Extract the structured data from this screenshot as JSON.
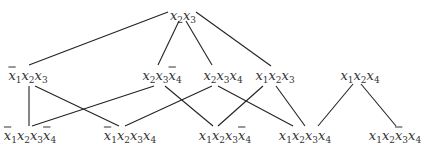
{
  "diagram": {
    "type": "lattice",
    "nodes": [
      {
        "id": "n_top",
        "label": "x2x3",
        "terms": [
          {
            "v": "x",
            "s": "2",
            "neg": false
          },
          {
            "v": "x",
            "s": "3",
            "neg": false
          }
        ],
        "x": 183,
        "y": 15
      },
      {
        "id": "n_m1",
        "label": "¬x1x2x3",
        "terms": [
          {
            "v": "x",
            "s": "1",
            "neg": true
          },
          {
            "v": "x",
            "s": "2",
            "neg": false
          },
          {
            "v": "x",
            "s": "3",
            "neg": false
          }
        ],
        "x": 28,
        "y": 75
      },
      {
        "id": "n_m2",
        "label": "x2x3¬x4",
        "terms": [
          {
            "v": "x",
            "s": "2",
            "neg": false
          },
          {
            "v": "x",
            "s": "3",
            "neg": false
          },
          {
            "v": "x",
            "s": "4",
            "neg": true
          }
        ],
        "x": 162,
        "y": 75
      },
      {
        "id": "n_m3",
        "label": "x2x3x4",
        "terms": [
          {
            "v": "x",
            "s": "2",
            "neg": false
          },
          {
            "v": "x",
            "s": "3",
            "neg": false
          },
          {
            "v": "x",
            "s": "4",
            "neg": false
          }
        ],
        "x": 223,
        "y": 75
      },
      {
        "id": "n_m4",
        "label": "x1x2x3",
        "terms": [
          {
            "v": "x",
            "s": "1",
            "neg": false
          },
          {
            "v": "x",
            "s": "2",
            "neg": false
          },
          {
            "v": "x",
            "s": "3",
            "neg": false
          }
        ],
        "x": 275,
        "y": 75
      },
      {
        "id": "n_m5",
        "label": "x1x2x4",
        "terms": [
          {
            "v": "x",
            "s": "1",
            "neg": false
          },
          {
            "v": "x",
            "s": "2",
            "neg": false
          },
          {
            "v": "x",
            "s": "4",
            "neg": false
          }
        ],
        "x": 360,
        "y": 75
      },
      {
        "id": "n_b1",
        "label": "¬x1x2x3¬x4",
        "terms": [
          {
            "v": "x",
            "s": "1",
            "neg": true
          },
          {
            "v": "x",
            "s": "2",
            "neg": false
          },
          {
            "v": "x",
            "s": "3",
            "neg": false
          },
          {
            "v": "x",
            "s": "4",
            "neg": true
          }
        ],
        "x": 30,
        "y": 135
      },
      {
        "id": "n_b2",
        "label": "¬x1x2x3x4",
        "terms": [
          {
            "v": "x",
            "s": "1",
            "neg": true
          },
          {
            "v": "x",
            "s": "2",
            "neg": false
          },
          {
            "v": "x",
            "s": "3",
            "neg": false
          },
          {
            "v": "x",
            "s": "4",
            "neg": false
          }
        ],
        "x": 130,
        "y": 135
      },
      {
        "id": "n_b3",
        "label": "x1x2x3¬x4",
        "terms": [
          {
            "v": "x",
            "s": "1",
            "neg": false
          },
          {
            "v": "x",
            "s": "2",
            "neg": false
          },
          {
            "v": "x",
            "s": "3",
            "neg": false
          },
          {
            "v": "x",
            "s": "4",
            "neg": true
          }
        ],
        "x": 225,
        "y": 135
      },
      {
        "id": "n_b4",
        "label": "x1x2x3x4",
        "terms": [
          {
            "v": "x",
            "s": "1",
            "neg": false
          },
          {
            "v": "x",
            "s": "2",
            "neg": false
          },
          {
            "v": "x",
            "s": "3",
            "neg": false
          },
          {
            "v": "x",
            "s": "4",
            "neg": false
          }
        ],
        "x": 305,
        "y": 135
      },
      {
        "id": "n_b5",
        "label": "x1x2¬x3x4",
        "terms": [
          {
            "v": "x",
            "s": "1",
            "neg": false
          },
          {
            "v": "x",
            "s": "2",
            "neg": false
          },
          {
            "v": "x",
            "s": "3",
            "neg": true
          },
          {
            "v": "x",
            "s": "4",
            "neg": false
          }
        ],
        "x": 395,
        "y": 135
      }
    ],
    "edges": [
      {
        "from": "n_top",
        "to": "n_m1",
        "x1": 168,
        "y1": 12,
        "x2": 29,
        "y2": 65
      },
      {
        "from": "n_top",
        "to": "n_m2",
        "x1": 179,
        "y1": 21,
        "x2": 158,
        "y2": 65
      },
      {
        "from": "n_top",
        "to": "n_m3",
        "x1": 186,
        "y1": 21,
        "x2": 212,
        "y2": 65
      },
      {
        "from": "n_top",
        "to": "n_m4",
        "x1": 196,
        "y1": 12,
        "x2": 271,
        "y2": 66
      },
      {
        "from": "n_m1",
        "to": "n_b1",
        "x1": 29,
        "y1": 86,
        "x2": 29,
        "y2": 126
      },
      {
        "from": "n_m1",
        "to": "n_b2",
        "x1": 35,
        "y1": 86,
        "x2": 119,
        "y2": 126
      },
      {
        "from": "n_m2",
        "to": "n_b1",
        "x1": 154,
        "y1": 86,
        "x2": 32,
        "y2": 126
      },
      {
        "from": "n_m2",
        "to": "n_b3",
        "x1": 165,
        "y1": 86,
        "x2": 213,
        "y2": 126
      },
      {
        "from": "n_m3",
        "to": "n_b2",
        "x1": 212,
        "y1": 86,
        "x2": 125,
        "y2": 126
      },
      {
        "from": "n_m3",
        "to": "n_b4",
        "x1": 218,
        "y1": 86,
        "x2": 293,
        "y2": 126
      },
      {
        "from": "n_m4",
        "to": "n_b3",
        "x1": 263,
        "y1": 86,
        "x2": 218,
        "y2": 126
      },
      {
        "from": "n_m4",
        "to": "n_b4",
        "x1": 276,
        "y1": 86,
        "x2": 305,
        "y2": 126
      },
      {
        "from": "n_m5",
        "to": "n_b4",
        "x1": 353,
        "y1": 84,
        "x2": 318,
        "y2": 126
      },
      {
        "from": "n_m5",
        "to": "n_b5",
        "x1": 361,
        "y1": 84,
        "x2": 396,
        "y2": 126
      }
    ]
  }
}
